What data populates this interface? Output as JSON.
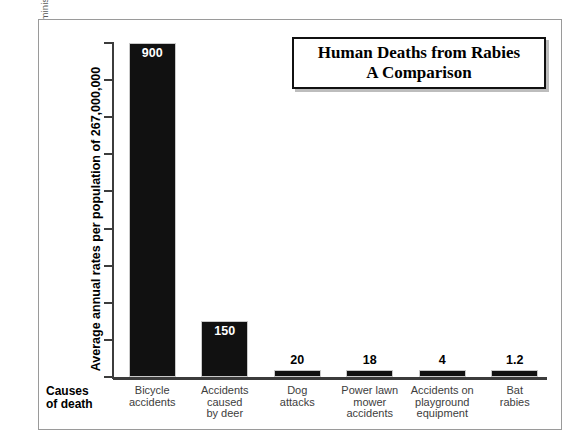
{
  "source_note": "From the International Classification of Diseases and the National Highway Traffic Safety Administration.",
  "title": {
    "line1": "Human Deaths from Rabies",
    "line2": "A Comparison"
  },
  "axes": {
    "y_title": "Average annual rates per population of 267,000,000",
    "x_title_line1": "Causes",
    "x_title_line2": "of death"
  },
  "chart_data": {
    "type": "bar",
    "title": "Human Deaths from Rabies A Comparison",
    "subtitle": "A Comparison",
    "xlabel": "Causes of death",
    "ylabel": "Average annual rates per population of 267,000,000",
    "ylim": [
      0,
      900
    ],
    "yticks": [
      0,
      100,
      200,
      300,
      400,
      500,
      600,
      700,
      800,
      900
    ],
    "ytick_labels": [
      "0",
      "100",
      "200",
      "300",
      "400",
      "500",
      "600",
      "700",
      "800",
      "900"
    ],
    "grid": false,
    "legend": "none",
    "bar_color": "#111111",
    "categories": [
      "Bicycle accidents",
      "Accidents caused by deer",
      "Dog attacks",
      "Power lawn mower accidents",
      "Accidents on playground equipment",
      "Bat rabies"
    ],
    "category_lines": [
      [
        "Bicycle",
        "accidents"
      ],
      [
        "Accidents",
        "caused",
        "by deer"
      ],
      [
        "Dog",
        "attacks"
      ],
      [
        "Power lawn",
        "mower",
        "accidents"
      ],
      [
        "Accidents on",
        "playground",
        "equipment"
      ],
      [
        "Bat",
        "rabies"
      ]
    ],
    "values": [
      900,
      150,
      20,
      18,
      4,
      1.2
    ],
    "value_labels": [
      "900",
      "150",
      "20",
      "18",
      "4",
      "1.2"
    ],
    "label_placement": [
      "inside",
      "inside",
      "outside",
      "outside",
      "outside",
      "outside"
    ]
  }
}
